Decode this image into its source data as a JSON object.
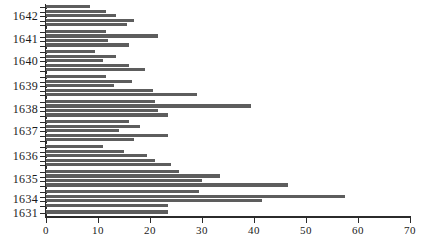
{
  "chart_data": {
    "type": "bar",
    "orientation": "horizontal",
    "title": "",
    "subtitle": "",
    "xlabel": "",
    "ylabel": "",
    "xlim": [
      0,
      70
    ],
    "ylim": null,
    "grid": false,
    "legend": null,
    "xticks": [
      0,
      10,
      20,
      30,
      40,
      50,
      60,
      70
    ],
    "xticklabels": [
      "0",
      "10",
      "20",
      "30",
      "40",
      "50",
      "60",
      "70"
    ],
    "categories": [
      "1642",
      "1641",
      "1640",
      "1639",
      "1638",
      "1637",
      "1636",
      "1635",
      "1634",
      "1631"
    ],
    "bar_color": "#5d5d5d",
    "axis_color": "#2b2b2b",
    "background": "#ffffff",
    "note": "Each year group contains 4 sub-bars; values read off the 0-70 axis.",
    "groups": [
      {
        "label": "1642",
        "values": [
          8.5,
          11.5,
          13.5,
          17.0,
          15.5
        ]
      },
      {
        "label": "1641",
        "values": [
          11.5,
          21.5,
          12.0,
          16.0
        ]
      },
      {
        "label": "1640",
        "values": [
          9.5,
          13.5,
          11.0,
          16.0,
          19.0
        ]
      },
      {
        "label": "1639",
        "values": [
          11.5,
          16.5,
          13.0,
          20.5,
          29.0
        ]
      },
      {
        "label": "1638",
        "values": [
          21.0,
          39.5,
          21.5,
          23.5
        ]
      },
      {
        "label": "1637",
        "values": [
          16.0,
          18.0,
          14.0,
          23.5,
          17.0
        ]
      },
      {
        "label": "1636",
        "values": [
          11.0,
          15.0,
          19.5,
          21.0,
          24.0
        ]
      },
      {
        "label": "1635",
        "values": [
          25.5,
          33.5,
          30.0,
          46.5
        ]
      },
      {
        "label": "1634",
        "values": [
          29.5,
          57.5,
          41.5,
          23.5
        ]
      },
      {
        "label": "1631",
        "values": [
          23.5
        ]
      }
    ],
    "values_flat": [
      8.5,
      11.5,
      13.5,
      17.0,
      15.5,
      11.5,
      21.5,
      12.0,
      16.0,
      9.5,
      13.5,
      11.0,
      16.0,
      19.0,
      11.5,
      16.5,
      13.0,
      20.5,
      29.0,
      21.0,
      39.5,
      21.5,
      23.5,
      16.0,
      18.0,
      14.0,
      23.5,
      17.0,
      11.0,
      15.0,
      19.5,
      21.0,
      24.0,
      25.5,
      33.5,
      30.0,
      46.5,
      29.5,
      57.5,
      41.5,
      23.5,
      23.5
    ]
  }
}
